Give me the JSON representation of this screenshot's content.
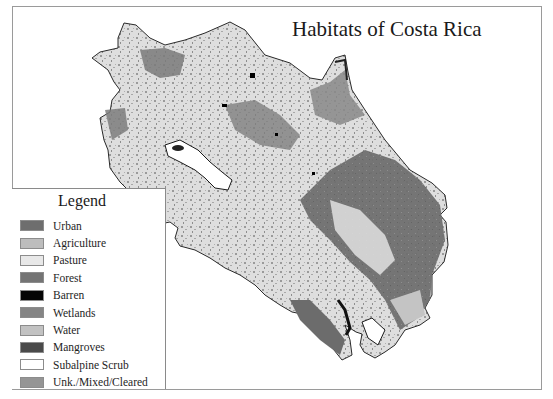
{
  "title": "Habitats of Costa Rica",
  "legend": {
    "title": "Legend",
    "items": [
      {
        "label": "Urban",
        "color": "#6e6e6e"
      },
      {
        "label": "Agriculture",
        "color": "#bdbdbd"
      },
      {
        "label": "Pasture",
        "color": "#e8e8e8"
      },
      {
        "label": "Forest",
        "color": "#747474"
      },
      {
        "label": "Barren",
        "color": "#050505"
      },
      {
        "label": "Wetlands",
        "color": "#858585"
      },
      {
        "label": "Water",
        "color": "#c2c2c2"
      },
      {
        "label": "Mangroves",
        "color": "#4a4a4a"
      },
      {
        "label": "Subalpine Scrub",
        "color": "#ffffff"
      },
      {
        "label": "Unk./Mixed/Cleared",
        "color": "#959595"
      }
    ]
  }
}
